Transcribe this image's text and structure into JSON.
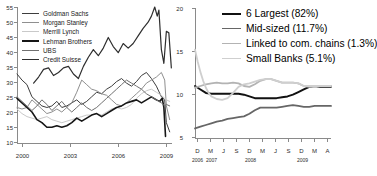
{
  "figure": {
    "panels": [
      "left-leverage-chart",
      "right-asset-share-chart"
    ]
  },
  "chart_data": [
    {
      "id": "left",
      "type": "line",
      "title": "",
      "xlabel": "",
      "ylabel": "",
      "xlim": [
        2000,
        2009.4
      ],
      "ylim": [
        10,
        55
      ],
      "grid": false,
      "legend_position": "top-left",
      "xticks": [
        "2000",
        "2003",
        "2006",
        "2009"
      ],
      "xtick_values": [
        2000,
        2003,
        2006,
        2009
      ],
      "yticks": [
        "10",
        "15",
        "20",
        "25",
        "30",
        "35",
        "40",
        "45",
        "50",
        "55"
      ],
      "ytick_values": [
        10,
        15,
        20,
        25,
        30,
        35,
        40,
        45,
        50,
        55
      ],
      "series": [
        {
          "name": "Goldman Sachs",
          "color": "#3d3d3d",
          "width": 1.0,
          "x": [
            2000.0,
            2000.3,
            2000.6,
            2000.9,
            2001.2,
            2001.5,
            2001.8,
            2002.1,
            2002.4,
            2002.7,
            2003.0,
            2003.3,
            2003.6,
            2003.9,
            2004.2,
            2004.5,
            2004.8,
            2005.1,
            2005.4,
            2005.7,
            2006.0,
            2006.3,
            2006.6,
            2006.9,
            2007.2,
            2007.5,
            2007.8,
            2008.1,
            2008.4,
            2008.7,
            2008.9,
            2009.0,
            2009.2
          ],
          "values": [
            33.0,
            31.0,
            29.5,
            25.5,
            24.0,
            22.5,
            22.0,
            22.5,
            24.0,
            22.0,
            22.5,
            23.5,
            24.5,
            23.0,
            24.0,
            25.5,
            27.0,
            26.5,
            28.0,
            29.0,
            30.5,
            31.5,
            30.0,
            29.0,
            30.5,
            32.5,
            33.5,
            31.5,
            29.0,
            25.5,
            24.5,
            17.0,
            14.0
          ]
        },
        {
          "name": "Morgan Stanley",
          "color": "#8f8f8f",
          "width": 1.0,
          "x": [
            2000.0,
            2000.3,
            2000.6,
            2000.9,
            2001.2,
            2001.5,
            2001.8,
            2002.1,
            2002.4,
            2002.7,
            2003.0,
            2003.3,
            2003.6,
            2003.9,
            2004.2,
            2004.5,
            2004.8,
            2005.1,
            2005.4,
            2005.7,
            2006.0,
            2006.3,
            2006.6,
            2006.9,
            2007.2,
            2007.5,
            2007.8,
            2008.1,
            2008.4,
            2008.7,
            2008.9,
            2009.0,
            2009.2
          ],
          "values": [
            22.0,
            21.5,
            22.0,
            24.5,
            23.0,
            21.5,
            20.0,
            20.5,
            21.5,
            20.5,
            22.0,
            23.5,
            27.0,
            31.0,
            29.5,
            28.0,
            27.5,
            26.5,
            26.0,
            24.5,
            23.0,
            22.5,
            23.5,
            25.0,
            26.5,
            28.0,
            30.0,
            31.0,
            32.0,
            33.5,
            31.0,
            22.5,
            18.0
          ]
        },
        {
          "name": "Merrill Lynch",
          "color": "#c9c9c9",
          "width": 1.0,
          "x": [
            2000.0,
            2000.3,
            2000.6,
            2000.9,
            2001.2,
            2001.5,
            2001.8,
            2002.1,
            2002.4,
            2002.7,
            2003.0,
            2003.3,
            2003.6,
            2003.9,
            2004.2,
            2004.5,
            2004.8,
            2005.1,
            2005.4,
            2005.7,
            2006.0,
            2006.3,
            2006.6,
            2006.9,
            2007.2,
            2007.5,
            2007.8,
            2008.1,
            2008.4,
            2008.7,
            2008.9,
            2009.0,
            2009.2
          ],
          "values": [
            21.5,
            20.0,
            19.0,
            18.5,
            18.0,
            18.5,
            19.0,
            18.0,
            17.5,
            17.0,
            17.5,
            18.0,
            18.5,
            19.0,
            19.5,
            19.5,
            20.0,
            19.5,
            20.5,
            21.5,
            22.0,
            21.5,
            22.0,
            23.0,
            25.0,
            26.5,
            27.5,
            28.0,
            27.0,
            26.0,
            25.0,
            24.5,
            24.0
          ]
        },
        {
          "name": "Lehman Brothers",
          "color": "#161616",
          "width": 1.6,
          "x": [
            2000.0,
            2000.3,
            2000.6,
            2000.9,
            2001.2,
            2001.5,
            2001.8,
            2002.1,
            2002.4,
            2002.7,
            2003.0,
            2003.3,
            2003.6,
            2003.9,
            2004.2,
            2004.5,
            2004.8,
            2005.1,
            2005.4,
            2005.7,
            2006.0,
            2006.3,
            2006.6,
            2006.9,
            2007.2,
            2007.5,
            2007.8,
            2008.1,
            2008.4,
            2008.6,
            2008.75,
            2008.85,
            2008.95
          ],
          "values": [
            25.0,
            23.5,
            22.0,
            20.5,
            18.0,
            17.0,
            15.5,
            15.5,
            16.0,
            15.5,
            16.0,
            17.0,
            18.5,
            17.5,
            18.5,
            19.5,
            20.0,
            19.0,
            20.0,
            21.0,
            22.0,
            22.5,
            23.5,
            24.0,
            24.5,
            23.5,
            24.5,
            25.5,
            24.5,
            24.0,
            25.0,
            22.0,
            12.5
          ]
        },
        {
          "name": "UBS",
          "color": "#707070",
          "width": 1.0,
          "x": [
            2000.0,
            2000.3,
            2000.6,
            2000.9,
            2001.2,
            2001.5,
            2001.8,
            2002.1,
            2002.4,
            2002.7,
            2003.0,
            2003.3,
            2003.6,
            2003.9,
            2004.2,
            2004.5,
            2004.8,
            2005.1,
            2005.4,
            2005.7,
            2006.0,
            2006.3,
            2006.6,
            2006.9,
            2007.2,
            2007.5,
            2007.8,
            2008.1,
            2008.4,
            2008.7,
            2008.9,
            2009.0,
            2009.2
          ],
          "values": [
            25.5,
            24.0,
            22.5,
            21.0,
            22.5,
            24.5,
            23.0,
            21.0,
            22.5,
            24.0,
            22.0,
            20.5,
            22.0,
            23.5,
            22.0,
            21.0,
            22.0,
            23.5,
            25.0,
            26.5,
            28.0,
            29.5,
            31.0,
            30.0,
            29.0,
            28.0,
            26.5,
            25.5,
            24.5,
            23.5,
            22.5,
            23.0,
            22.5
          ]
        },
        {
          "name": "Credit Suisse",
          "color": "#2e2e2e",
          "width": 1.2,
          "x": [
            2001.0,
            2001.3,
            2001.6,
            2001.9,
            2002.2,
            2002.5,
            2002.8,
            2003.1,
            2003.4,
            2003.7,
            2004.0,
            2004.3,
            2004.6,
            2004.9,
            2005.2,
            2005.5,
            2005.8,
            2006.1,
            2006.4,
            2006.7,
            2007.0,
            2007.3,
            2007.6,
            2007.9,
            2008.1,
            2008.3,
            2008.45,
            2008.55,
            2008.7,
            2008.85,
            2009.0,
            2009.15,
            2009.3
          ],
          "values": [
            30.0,
            32.0,
            34.5,
            35.0,
            32.5,
            33.5,
            35.0,
            35.5,
            33.0,
            31.5,
            35.5,
            38.5,
            41.0,
            39.0,
            41.5,
            45.0,
            42.0,
            40.0,
            43.0,
            41.5,
            43.0,
            45.5,
            48.0,
            50.0,
            52.0,
            55.0,
            52.0,
            54.0,
            41.0,
            36.5,
            47.0,
            46.5,
            35.0
          ]
        }
      ]
    },
    {
      "id": "right",
      "type": "line",
      "title": "",
      "xlabel": "",
      "ylabel": "",
      "ylim": [
        5,
        20
      ],
      "grid": false,
      "legend_position": "top-right",
      "yticks": [
        "5",
        "10",
        "15",
        "20"
      ],
      "ytick_values": [
        5,
        10,
        15,
        20
      ],
      "xticks": [
        "D",
        "M",
        "J",
        "S",
        "D",
        "M",
        "J",
        "S",
        "D",
        "M",
        "A"
      ],
      "xtick_years": [
        {
          "label": "2006",
          "at": 0
        },
        {
          "label": "2007",
          "at": 1
        },
        {
          "label": "2008",
          "at": 4
        },
        {
          "label": "2009",
          "at": 8
        }
      ],
      "series": [
        {
          "name": "6 Largest (82%)",
          "color": "#111111",
          "width": 2.0,
          "x": [
            0,
            0.4,
            0.8,
            1.2,
            1.6,
            2.0,
            2.4,
            2.8,
            3.2,
            3.6,
            4.0,
            4.4,
            4.8,
            5.2,
            5.6,
            6.0,
            6.4,
            6.8,
            7.2,
            7.6,
            8.0,
            8.4,
            8.8,
            9.2,
            9.6,
            10.0
          ],
          "values": [
            11.0,
            10.6,
            10.2,
            10.1,
            10.1,
            10.1,
            10.1,
            10.1,
            10.1,
            10.0,
            9.8,
            9.6,
            9.6,
            9.6,
            9.6,
            9.6,
            9.7,
            9.8,
            10.0,
            10.3,
            10.6,
            10.9,
            11.0,
            10.9,
            10.9,
            10.9
          ]
        },
        {
          "name": "Mid-sized (11.7%)",
          "color": "#666666",
          "width": 1.8,
          "x": [
            0,
            0.4,
            0.8,
            1.2,
            1.6,
            2.0,
            2.4,
            2.8,
            3.2,
            3.6,
            4.0,
            4.4,
            4.8,
            5.2,
            5.6,
            6.0,
            6.4,
            6.8,
            7.2,
            7.6,
            8.0,
            8.4,
            8.8,
            9.2,
            9.6,
            10.0
          ],
          "values": [
            6.1,
            6.3,
            6.5,
            6.7,
            6.9,
            7.0,
            7.2,
            7.3,
            7.4,
            7.5,
            7.8,
            8.2,
            8.5,
            8.5,
            8.5,
            8.5,
            8.6,
            8.7,
            8.8,
            8.7,
            8.6,
            8.6,
            8.7,
            8.7,
            8.7,
            8.7
          ]
        },
        {
          "name": "Linked to com. chains (1.3%)",
          "color": "#b3b3b3",
          "width": 1.8,
          "x": [
            0,
            0.4,
            0.8,
            1.2,
            1.6,
            2.0,
            2.4,
            2.8,
            3.2,
            3.6,
            4.0,
            4.4,
            4.8,
            5.2,
            5.6,
            6.0,
            6.4,
            6.8,
            7.2,
            7.6,
            8.0,
            8.4,
            8.8,
            9.2,
            9.6,
            10.0
          ],
          "values": [
            10.8,
            11.0,
            11.2,
            11.3,
            11.4,
            11.3,
            11.3,
            11.4,
            11.3,
            11.0,
            10.9,
            11.2,
            11.6,
            11.8,
            11.8,
            11.6,
            11.4,
            11.4,
            11.4,
            11.3,
            11.0,
            10.9,
            11.0,
            11.0,
            11.0,
            11.0
          ]
        },
        {
          "name": "Small Banks (5.1%)",
          "color": "#cfcfcf",
          "width": 1.8,
          "x": [
            0,
            0.2,
            0.4,
            0.6,
            0.8,
            1.0,
            1.2,
            1.6,
            2.0,
            2.4,
            2.8,
            3.2,
            3.6,
            4.0,
            4.4,
            4.8,
            5.2,
            5.6,
            6.0,
            6.4,
            6.8,
            7.2,
            7.6,
            8.0,
            8.4,
            8.8,
            9.2,
            9.6,
            10.0
          ],
          "values": [
            15.2,
            13.8,
            12.6,
            11.6,
            10.8,
            10.2,
            9.8,
            9.5,
            9.4,
            9.6,
            10.2,
            10.9,
            11.2,
            11.3,
            11.5,
            11.7,
            11.8,
            11.8,
            11.6,
            11.4,
            11.4,
            11.4,
            11.3,
            11.0,
            11.0,
            11.0,
            11.0,
            11.0,
            11.0
          ]
        }
      ]
    }
  ]
}
